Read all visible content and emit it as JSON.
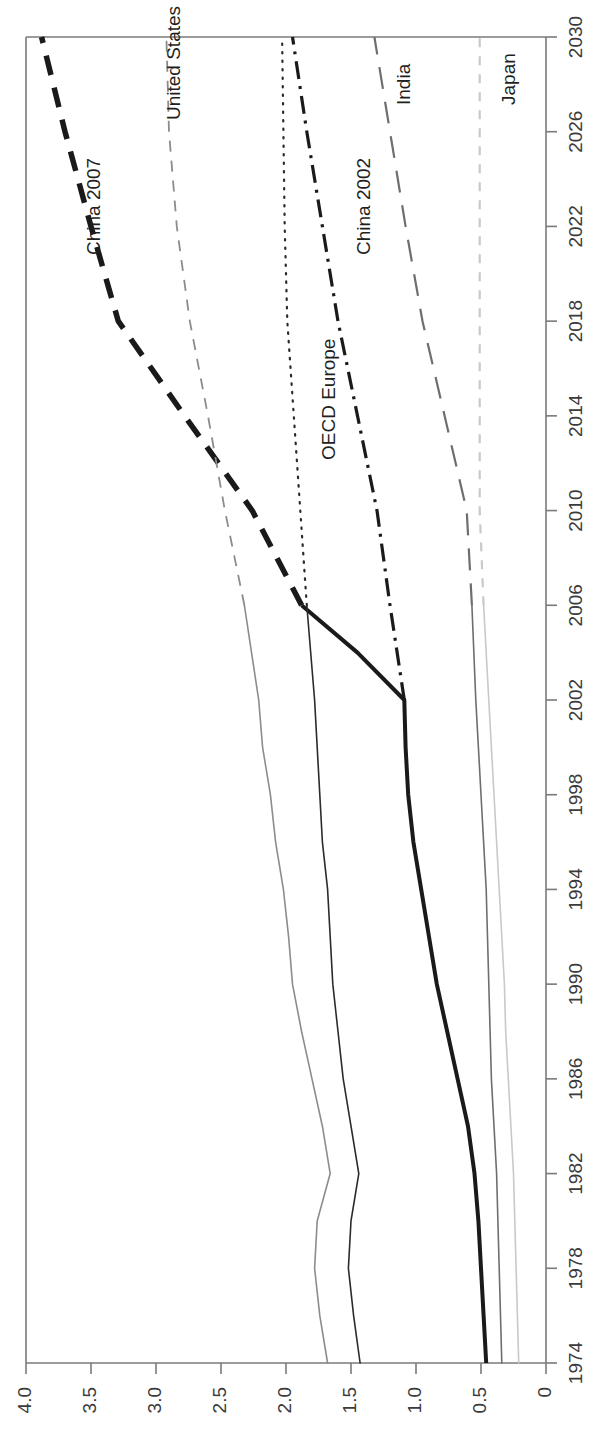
{
  "figure": {
    "orientation": "rotated-90",
    "value_axis": {
      "ticks": [
        "4.0",
        "3.5",
        "3.0",
        "2.5",
        "2.0",
        "1.5",
        "1.0",
        "0.5",
        "0"
      ],
      "tick_values": [
        4.0,
        3.5,
        3.0,
        2.5,
        2.0,
        1.5,
        1.0,
        0.5,
        0
      ],
      "min": 0,
      "max": 4.0
    },
    "year_axis": {
      "ticks": [
        "1974",
        "1978",
        "1982",
        "1986",
        "1990",
        "1994",
        "1998",
        "2002",
        "2006",
        "2010",
        "2014",
        "2018",
        "2022",
        "2026",
        "2030"
      ],
      "tick_values": [
        1974,
        1978,
        1982,
        1986,
        1990,
        1994,
        1998,
        2002,
        2006,
        2010,
        2014,
        2018,
        2022,
        2026,
        2030
      ],
      "min": 1974,
      "max": 2030
    },
    "colors": {
      "china": "#1a1a1a",
      "oecd_europe": "#2b2b2b",
      "united_states": "#8c8c8c",
      "india": "#6e6e6e",
      "japan": "#c9c9c9",
      "axis": "#7a7a7a",
      "text": "#3b3b3b"
    },
    "series_labels": {
      "china_2007": "China 2007",
      "china_2002": "China 2002",
      "united_states": "United States",
      "oecd_europe": "OECD Europe",
      "india": "India",
      "japan": "Japan"
    }
  },
  "chart_data": {
    "type": "line",
    "title": "",
    "subtitle": "",
    "xlabel": "",
    "ylabel": "",
    "xlim": [
      1974,
      2030
    ],
    "ylim": [
      0,
      4.0
    ],
    "grid": false,
    "legend": "inline-labels",
    "x": [
      1974,
      1976,
      1978,
      1980,
      1982,
      1984,
      1986,
      1988,
      1990,
      1992,
      1994,
      1996,
      1998,
      2000,
      2002,
      2004,
      2006,
      2010,
      2014,
      2018,
      2022,
      2026,
      2030
    ],
    "series": [
      {
        "name": "China 2007",
        "label": "China 2007",
        "style": "thick-dashed",
        "color": "#1a1a1a",
        "segment": "projection",
        "x": [
          2006,
          2010,
          2014,
          2018,
          2022,
          2026,
          2030
        ],
        "values": [
          1.88,
          2.26,
          2.78,
          3.29,
          3.5,
          3.7,
          3.88
        ]
      },
      {
        "name": "China 2002",
        "label": "China 2002",
        "style": "dash-dot",
        "color": "#1a1a1a",
        "segment": "projection",
        "x": [
          2002,
          2006,
          2010,
          2014,
          2018,
          2022,
          2026,
          2030
        ],
        "values": [
          1.09,
          1.2,
          1.3,
          1.45,
          1.6,
          1.72,
          1.84,
          1.95
        ]
      },
      {
        "name": "China historical",
        "label": "",
        "style": "thick-solid",
        "color": "#1a1a1a",
        "segment": "history",
        "x": [
          1974,
          1976,
          1978,
          1980,
          1982,
          1984,
          1986,
          1988,
          1990,
          1992,
          1994,
          1996,
          1998,
          2000,
          2002,
          2004,
          2006
        ],
        "values": [
          0.46,
          0.48,
          0.5,
          0.52,
          0.55,
          0.6,
          0.68,
          0.76,
          0.84,
          0.9,
          0.96,
          1.02,
          1.06,
          1.08,
          1.09,
          1.45,
          1.88
        ]
      },
      {
        "name": "United States",
        "label": "United States",
        "style": "thin-solid-then-dashed",
        "color": "#8c8c8c",
        "segment": "history+projection",
        "x": [
          1974,
          1976,
          1978,
          1980,
          1982,
          1984,
          1986,
          1988,
          1990,
          1992,
          1994,
          1996,
          1998,
          2000,
          2002,
          2006,
          2010,
          2014,
          2018,
          2022,
          2026,
          2030
        ],
        "values": [
          1.68,
          1.74,
          1.78,
          1.76,
          1.66,
          1.72,
          1.8,
          1.88,
          1.95,
          1.98,
          2.02,
          2.08,
          2.12,
          2.18,
          2.21,
          2.32,
          2.47,
          2.6,
          2.74,
          2.84,
          2.9,
          2.92
        ]
      },
      {
        "name": "OECD Europe",
        "label": "OECD Europe",
        "style": "thin-solid-then-dotted",
        "color": "#2b2b2b",
        "segment": "history+projection",
        "x": [
          1974,
          1976,
          1978,
          1980,
          1982,
          1984,
          1986,
          1988,
          1990,
          1992,
          1994,
          1996,
          1998,
          2000,
          2002,
          2006,
          2010,
          2014,
          2018,
          2022,
          2026,
          2030
        ],
        "values": [
          1.43,
          1.48,
          1.52,
          1.5,
          1.44,
          1.5,
          1.56,
          1.6,
          1.64,
          1.66,
          1.68,
          1.72,
          1.74,
          1.76,
          1.78,
          1.84,
          1.89,
          1.94,
          1.99,
          2.01,
          2.02,
          2.03
        ]
      },
      {
        "name": "India",
        "label": "India",
        "style": "thin-solid-then-long-dash",
        "color": "#6e6e6e",
        "segment": "history+projection",
        "x": [
          1974,
          1976,
          1978,
          1980,
          1982,
          1984,
          1986,
          1988,
          1990,
          1992,
          1994,
          1996,
          1998,
          2000,
          2002,
          2006,
          2010,
          2014,
          2018,
          2022,
          2026,
          2030
        ],
        "values": [
          0.34,
          0.35,
          0.36,
          0.37,
          0.38,
          0.4,
          0.42,
          0.43,
          0.44,
          0.45,
          0.46,
          0.48,
          0.5,
          0.52,
          0.54,
          0.57,
          0.61,
          0.78,
          0.95,
          1.08,
          1.2,
          1.32
        ]
      },
      {
        "name": "Japan",
        "label": "Japan",
        "style": "thin-solid-then-dashed-light",
        "color": "#c9c9c9",
        "segment": "history+projection",
        "x": [
          1974,
          1976,
          1978,
          1980,
          1982,
          1984,
          1986,
          1988,
          1990,
          1992,
          1994,
          1996,
          1998,
          2000,
          2002,
          2006,
          2010,
          2014,
          2018,
          2022,
          2026,
          2030
        ],
        "values": [
          0.21,
          0.22,
          0.23,
          0.24,
          0.25,
          0.27,
          0.29,
          0.31,
          0.32,
          0.34,
          0.36,
          0.38,
          0.4,
          0.42,
          0.44,
          0.48,
          0.51,
          0.51,
          0.51,
          0.51,
          0.51,
          0.51
        ]
      }
    ]
  }
}
